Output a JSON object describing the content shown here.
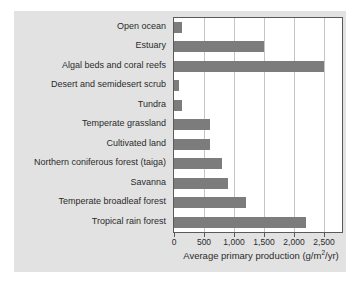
{
  "chart_data": {
    "type": "bar",
    "orientation": "horizontal",
    "title": "",
    "xlabel": "Average primary production (g/m2/yr)",
    "xlabel_parts": {
      "before": "Average primary production (g/m",
      "sup": "2",
      "after": "/yr)"
    },
    "ylabel": "",
    "categories": [
      "Open ocean",
      "Estuary",
      "Algal beds and coral reefs",
      "Desert and semidesert scrub",
      "Tundra",
      "Temperate grassland",
      "Cultivated land",
      "Northern coniferous forest (taiga)",
      "Savanna",
      "Temperate broadleaf forest",
      "Tropical rain forest"
    ],
    "values": [
      125,
      1500,
      2500,
      90,
      140,
      600,
      600,
      800,
      900,
      1200,
      2200
    ],
    "xlim": [
      0,
      2800
    ],
    "xticks": [
      0,
      500,
      1000,
      1500,
      2000,
      2500
    ],
    "xticklabels": [
      "0",
      "500",
      "1,000",
      "1,500",
      "2,000",
      "2,500"
    ],
    "grid": "vertical",
    "legend": "none",
    "bar_color": "#7c7c7c",
    "plot_background": "#ffffff",
    "figure_background": "#e2e2e2",
    "axis_color": "#5a5a5a",
    "gridline_color": "#c4c4c4"
  }
}
